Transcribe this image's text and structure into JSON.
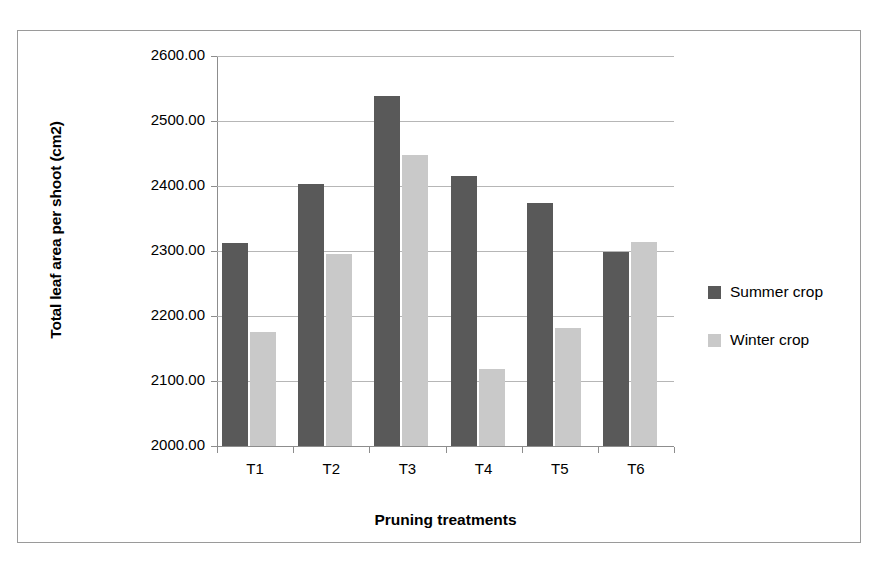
{
  "chart_data": {
    "type": "bar",
    "title": "",
    "xlabel": "Pruning treatments",
    "ylabel": "Total leaf area per shoot (cm2)",
    "categories": [
      "T1",
      "T2",
      "T3",
      "T4",
      "T5",
      "T6"
    ],
    "series": [
      {
        "name": "Summer crop",
        "color": "#595959",
        "values": [
          2313,
          2403,
          2538,
          2416,
          2374,
          2298
        ]
      },
      {
        "name": "Winter crop",
        "color": "#c9c9c9",
        "values": [
          2175,
          2296,
          2448,
          2118,
          2182,
          2314
        ]
      }
    ],
    "ylim": [
      2000,
      2600
    ],
    "ytick_values": [
      2000,
      2100,
      2200,
      2300,
      2400,
      2500,
      2600
    ],
    "ytick_labels": [
      "2000.00",
      "2100.00",
      "2200.00",
      "2300.00",
      "2400.00",
      "2500.00",
      "2600.00"
    ],
    "grid": true,
    "legend_position": "right"
  },
  "figure": {
    "border_color": "#9a9a9a",
    "background": "#ffffff",
    "grid_color": "#b6b6b6",
    "axis_color": "#8d8d8d"
  }
}
